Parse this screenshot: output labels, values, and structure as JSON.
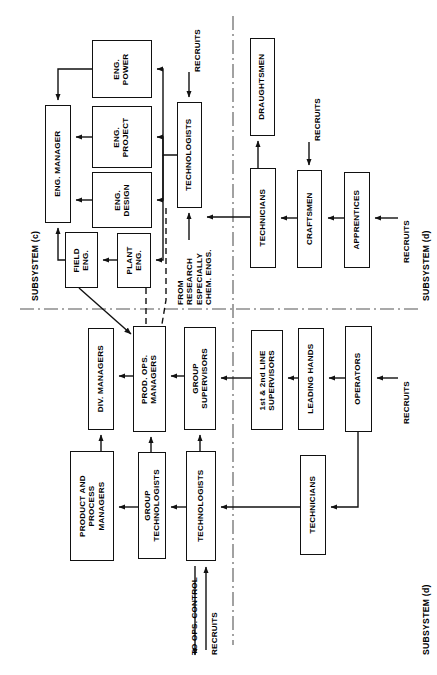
{
  "diagram": {
    "orientation": "rotated-90-ccw",
    "stroke_color": "#111111",
    "background_color": "#ffffff"
  },
  "subsystem_labels": [
    {
      "id": "sys-c-left",
      "text": "SUBSYSTEM (c)"
    },
    {
      "id": "sys-d-topright",
      "text": "SUBSYSTEM (d)"
    },
    {
      "id": "sys-d-botright",
      "text": "SUBSYSTEM (d)"
    }
  ],
  "quadrants": {
    "top_left": {
      "name": "engineering-subsystem-c"
    },
    "top_right": {
      "name": "technical-trades-subsystem-d"
    },
    "bottom_left": {
      "name": "production-management-subsystem-d"
    },
    "bottom_right": {
      "name": "production-line-subsystem-d"
    }
  },
  "nodes": [
    {
      "id": "eng-power",
      "label": "ENG.\nPOWER",
      "x": 92,
      "y": 40,
      "w": 60,
      "h": 58
    },
    {
      "id": "eng-project",
      "label": "ENG.\nPROJECT",
      "x": 92,
      "y": 106,
      "w": 60,
      "h": 62
    },
    {
      "id": "eng-design",
      "label": "ENG.\nDESIGN",
      "x": 92,
      "y": 172,
      "w": 60,
      "h": 56
    },
    {
      "id": "eng-manager",
      "label": "ENG. MANAGER",
      "x": 45,
      "y": 105,
      "w": 26,
      "h": 118
    },
    {
      "id": "field-eng",
      "label": "FIELD\nENG.",
      "x": 65,
      "y": 232,
      "w": 33,
      "h": 56
    },
    {
      "id": "plant-eng",
      "label": "PLANT\nENG.",
      "x": 117,
      "y": 233,
      "w": 34,
      "h": 55
    },
    {
      "id": "technologists-c",
      "label": "TECHNOLOGISTS",
      "x": 177,
      "y": 102,
      "w": 25,
      "h": 106
    },
    {
      "id": "draughtsmen",
      "label": "DRAUGHTSMEN",
      "x": 250,
      "y": 38,
      "w": 25,
      "h": 98
    },
    {
      "id": "technicians-d-top",
      "label": "TECHNICIANS",
      "x": 250,
      "y": 168,
      "w": 26,
      "h": 100
    },
    {
      "id": "craftsmen",
      "label": "CRAFTSMEN",
      "x": 297,
      "y": 170,
      "w": 25,
      "h": 98
    },
    {
      "id": "apprentices",
      "label": "APPRENTICES",
      "x": 344,
      "y": 172,
      "w": 26,
      "h": 96
    },
    {
      "id": "div-managers",
      "label": "DIV. MANAGERS",
      "x": 88,
      "y": 328,
      "w": 26,
      "h": 102
    },
    {
      "id": "prod-ops-managers",
      "label": "PROD. OPS.\nMANAGERS",
      "x": 133,
      "y": 326,
      "w": 33,
      "h": 106
    },
    {
      "id": "group-supervisors",
      "label": "GROUP\nSUPERVISORS",
      "x": 184,
      "y": 327,
      "w": 32,
      "h": 103
    },
    {
      "id": "first-second-line",
      "label": "1st & 2nd LINE\nSUPERVISORS",
      "x": 251,
      "y": 330,
      "w": 32,
      "h": 100
    },
    {
      "id": "leading-hands",
      "label": "LEADING HANDS",
      "x": 298,
      "y": 328,
      "w": 26,
      "h": 102
    },
    {
      "id": "operators",
      "label": "OPERATORS",
      "x": 345,
      "y": 326,
      "w": 27,
      "h": 106
    },
    {
      "id": "product-process-mg",
      "label": "PRODUCT AND\nPROCESS\nMANAGERS",
      "x": 70,
      "y": 451,
      "w": 44,
      "h": 110
    },
    {
      "id": "group-technologists",
      "label": "GROUP\nTECHNOLOGISTS",
      "x": 138,
      "y": 452,
      "w": 28,
      "h": 107
    },
    {
      "id": "technologists-d",
      "label": "TECHNOLOGISTS",
      "x": 186,
      "y": 451,
      "w": 30,
      "h": 110
    },
    {
      "id": "technicians-d-bot",
      "label": "TECHNICIANS",
      "x": 300,
      "y": 455,
      "w": 26,
      "h": 100
    }
  ],
  "annotations": [
    {
      "id": "recruits-technologists-c",
      "text": "RECRUITS"
    },
    {
      "id": "recruits-draughtsmen",
      "text": "RECRUITS"
    },
    {
      "id": "recruits-apprentices",
      "text": "RECRUITS"
    },
    {
      "id": "recruits-operators",
      "text": "RECRUITS"
    },
    {
      "id": "recruits-technologists-d",
      "text": "RECRUITS"
    },
    {
      "id": "from-research",
      "text": "FROM\nRESEARCH\nESPECIALLY\nCHEM. ENGS."
    },
    {
      "id": "to-ops-control",
      "text": "TO OPS. CONTROL"
    }
  ]
}
